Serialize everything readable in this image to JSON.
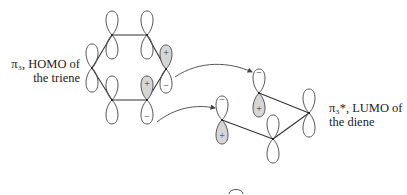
{
  "labels": {
    "triene_line1": "π₃, HOMO of",
    "triene_line2": "the triene",
    "diene_line1": "π₃*, LUMO of",
    "diene_line2": "the diene"
  },
  "signs": {
    "plus": "+",
    "minus": "−"
  },
  "triene": {
    "name": "triene",
    "orbital": "HOMO π3",
    "atoms": [
      {
        "id": "t1",
        "x": 112,
        "y": 35,
        "top_sign": "",
        "bottom_sign": "",
        "shaded": "none"
      },
      {
        "id": "t2",
        "x": 147,
        "y": 35,
        "top_sign": "",
        "bottom_sign": "",
        "shaded": "none"
      },
      {
        "id": "t3",
        "x": 166,
        "y": 69,
        "top_sign": "+",
        "bottom_sign": "−",
        "shaded": "top"
      },
      {
        "id": "t4",
        "x": 147,
        "y": 100,
        "top_sign": "+",
        "bottom_sign": "−",
        "shaded": "top"
      },
      {
        "id": "t5",
        "x": 112,
        "y": 100,
        "top_sign": "",
        "bottom_sign": "",
        "shaded": "none"
      },
      {
        "id": "t6",
        "x": 92,
        "y": 68,
        "top_sign": "",
        "bottom_sign": "",
        "shaded": "none"
      }
    ]
  },
  "diene": {
    "name": "diene",
    "orbital": "LUMO π3*",
    "atoms": [
      {
        "id": "d1",
        "x": 222,
        "y": 120,
        "top_sign": "−",
        "bottom_sign": "+",
        "shaded": "bottom"
      },
      {
        "id": "d2",
        "x": 259,
        "y": 93,
        "top_sign": "−",
        "bottom_sign": "+",
        "shaded": "bottom"
      },
      {
        "id": "d3",
        "x": 273,
        "y": 139,
        "top_sign": "",
        "bottom_sign": "",
        "shaded": "none"
      },
      {
        "id": "d4",
        "x": 309,
        "y": 113,
        "top_sign": "",
        "bottom_sign": "",
        "shaded": "none"
      }
    ]
  },
  "interactions": [
    {
      "from": "t3",
      "to": "d2"
    },
    {
      "from": "t4",
      "to": "d1"
    }
  ]
}
